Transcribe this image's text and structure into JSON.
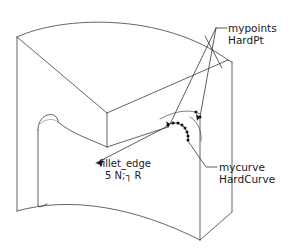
{
  "figure": {
    "name": "annotated-cad-solid",
    "background_color": "#ffffff",
    "line_color": "#3c3c42",
    "marker_color": "#111115",
    "width": 295,
    "height": 249
  },
  "annotations": {
    "mypoints": {
      "line1": "mypoints",
      "line2": "HardPt",
      "target_count": 2
    },
    "mycurve": {
      "line1": "mycurve",
      "line2": "HardCurve"
    },
    "fillet": {
      "line1": "fillet_edge",
      "line2": "5 N;┐ R"
    }
  },
  "geometry": {
    "hard_points": [
      {
        "x": 168,
        "y": 125
      },
      {
        "x": 173,
        "y": 123
      },
      {
        "x": 178,
        "y": 123
      },
      {
        "x": 182,
        "y": 125
      },
      {
        "x": 185,
        "y": 128
      },
      {
        "x": 187,
        "y": 132
      },
      {
        "x": 188,
        "y": 136
      },
      {
        "x": 188,
        "y": 140
      },
      {
        "x": 196,
        "y": 112
      },
      {
        "x": 200,
        "y": 117
      }
    ]
  }
}
